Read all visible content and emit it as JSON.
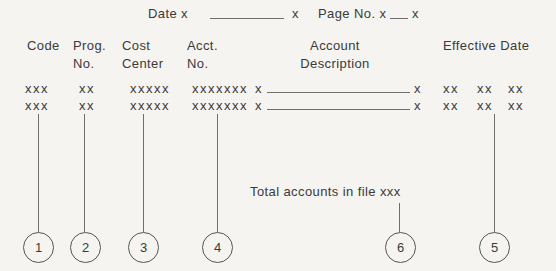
{
  "page": {
    "background": "#f5f4f1",
    "ink": "#3a3a3a",
    "line_color": "#6f6f6f"
  },
  "topline": {
    "date_prefix": "Date x",
    "date_suffix": "x",
    "page_prefix": "Page No. x",
    "page_suffix": "x"
  },
  "columns": [
    {
      "line1": "Code",
      "line2": ""
    },
    {
      "line1": "Prog.",
      "line2": "No."
    },
    {
      "line1": "Cost",
      "line2": "Center"
    },
    {
      "line1": "Acct.",
      "line2": "No."
    },
    {
      "line1": "Account",
      "line2": "Description"
    },
    {
      "line1": "Effective Date",
      "line2": ""
    }
  ],
  "rows": [
    {
      "code": "xxx",
      "prog_no": "xx",
      "cost_center": "xxxxx",
      "acct_no": "xxxxxxx",
      "desc_open": "x",
      "desc_close": "x",
      "eff": [
        "xx",
        "xx",
        "xx"
      ]
    },
    {
      "code": "xxx",
      "prog_no": "xx",
      "cost_center": "xxxxx",
      "acct_no": "xxxxxxx",
      "desc_open": "x",
      "desc_close": "x",
      "eff": [
        "xx",
        "xx",
        "xx"
      ]
    }
  ],
  "footer": {
    "total_text": "Total accounts in file xxx"
  },
  "callouts": [
    {
      "number": "1"
    },
    {
      "number": "2"
    },
    {
      "number": "3"
    },
    {
      "number": "4"
    },
    {
      "number": "6"
    },
    {
      "number": "5"
    }
  ]
}
